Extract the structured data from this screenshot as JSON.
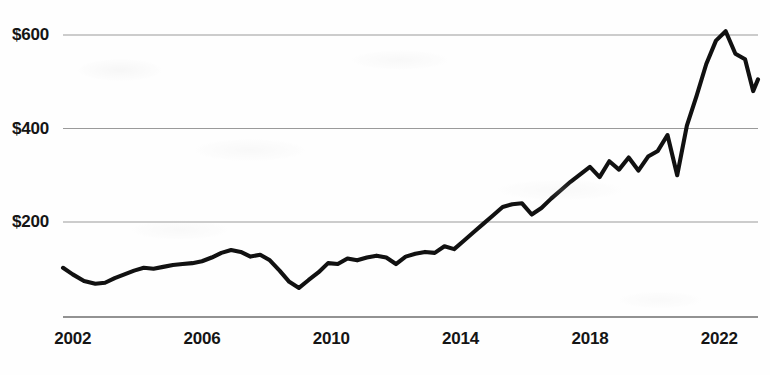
{
  "chart_data": {
    "type": "line",
    "title": "",
    "subtitle": "",
    "xlabel": "",
    "ylabel": "",
    "xlim": [
      2001.7,
      2023.2
    ],
    "ylim": [
      0,
      660
    ],
    "grid": true,
    "grid_axis": "y",
    "legend": false,
    "legend_position": "none",
    "y_ticks": [
      200,
      400,
      600
    ],
    "y_tick_labels": [
      "$200",
      "$400",
      "$600"
    ],
    "x_ticks": [
      2002,
      2006,
      2010,
      2014,
      2018,
      2022
    ],
    "x_tick_labels": [
      "2002",
      "2006",
      "2010",
      "2014",
      "2018",
      "2022"
    ],
    "line_color": "#111111",
    "grid_color": "#9a9a9a",
    "axis_color": "#6e6e6e",
    "background_color": "#fefefe",
    "series": [
      {
        "name": "Value",
        "x": [
          2001.7,
          2002.0,
          2002.35,
          2002.7,
          2003.0,
          2003.3,
          2003.6,
          2003.9,
          2004.2,
          2004.5,
          2004.8,
          2005.1,
          2005.4,
          2005.7,
          2006.0,
          2006.3,
          2006.6,
          2006.9,
          2007.2,
          2007.5,
          2007.8,
          2008.1,
          2008.4,
          2008.7,
          2009.0,
          2009.3,
          2009.6,
          2009.9,
          2010.2,
          2010.5,
          2010.8,
          2011.1,
          2011.4,
          2011.7,
          2012.0,
          2012.3,
          2012.6,
          2012.9,
          2013.2,
          2013.5,
          2013.8,
          2014.1,
          2014.4,
          2014.7,
          2015.0,
          2015.3,
          2015.6,
          2015.9,
          2016.2,
          2016.5,
          2016.8,
          2017.1,
          2017.4,
          2017.7,
          2018.0,
          2018.3,
          2018.6,
          2018.9,
          2019.2,
          2019.5,
          2019.8,
          2020.1,
          2020.4,
          2020.7,
          2021.0,
          2021.3,
          2021.6,
          2021.9,
          2022.2,
          2022.5,
          2022.8,
          2023.05,
          2023.2
        ],
        "y": [
          102,
          88,
          74,
          68,
          70,
          80,
          88,
          96,
          102,
          100,
          104,
          108,
          110,
          112,
          116,
          124,
          134,
          140,
          136,
          126,
          130,
          118,
          96,
          72,
          59,
          76,
          92,
          112,
          110,
          122,
          118,
          124,
          128,
          124,
          110,
          126,
          132,
          136,
          134,
          148,
          142,
          160,
          178,
          196,
          214,
          232,
          238,
          240,
          216,
          230,
          250,
          268,
          286,
          302,
          318,
          296,
          330,
          312,
          338,
          310,
          340,
          352,
          386,
          300,
          406,
          470,
          538,
          588,
          608,
          560,
          548,
          480,
          505
        ]
      }
    ],
    "annotations": []
  },
  "figure": {
    "currency_prefix": "$"
  }
}
